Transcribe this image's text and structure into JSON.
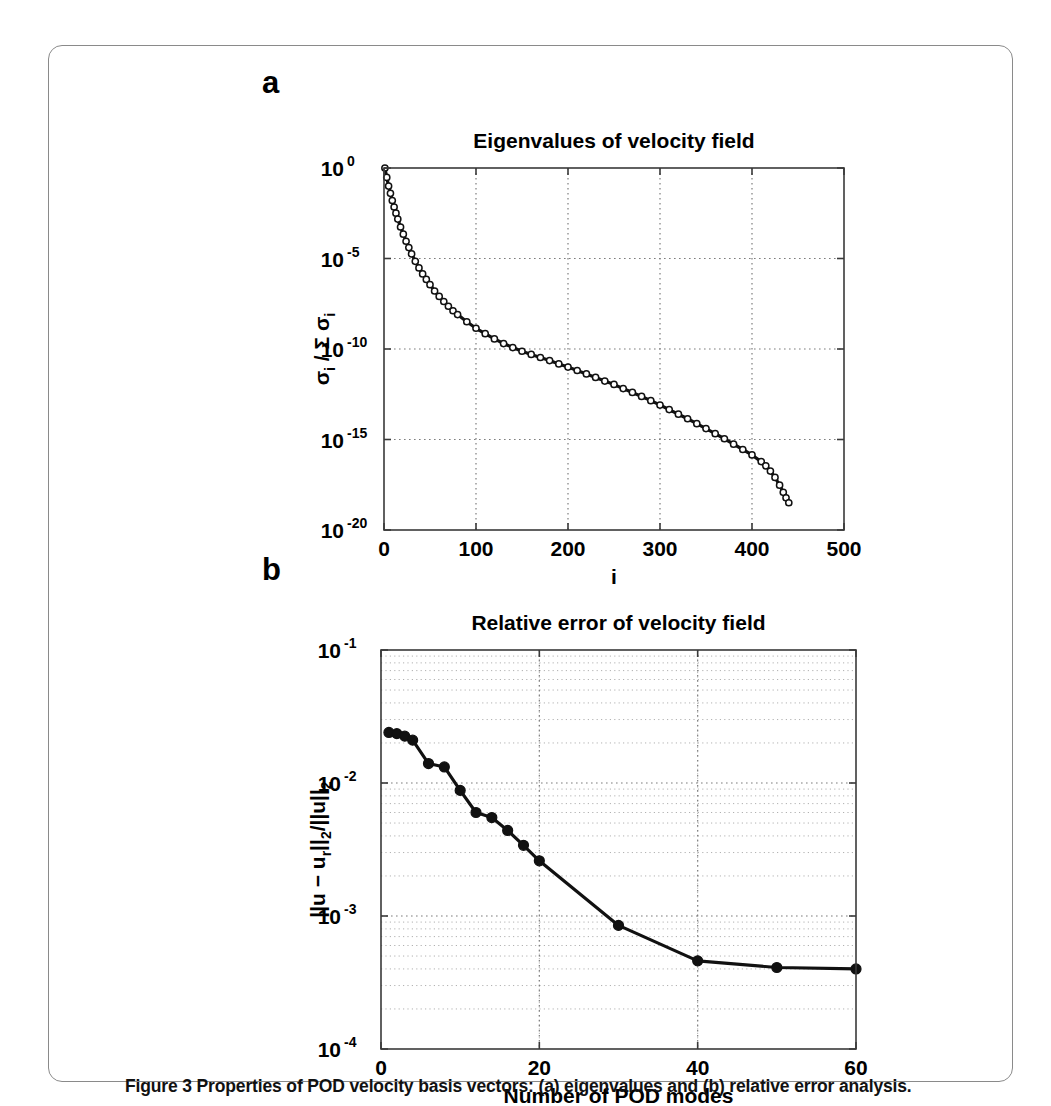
{
  "figure": {
    "caption": "Figure 3 Properties of POD velocity basis vectors: (a) eigenvalues and (b) relative error analysis.",
    "panel_a_letter": "a",
    "panel_b_letter": "b",
    "border_color": "#8a8a8a",
    "line_color": "#111111",
    "grid_color": "#7d7d7d"
  },
  "chart_data": [
    {
      "id": "panel-a",
      "type": "line",
      "title": "Eigenvalues of velocity field",
      "xlabel": "i",
      "ylabel": "σi / Σ σi",
      "ylabel_parts": {
        "sigma": "σ",
        "sub_i": "i",
        "slash": " / ",
        "sum": "Σ"
      },
      "xscale": "linear",
      "yscale": "log",
      "xlim": [
        0,
        500
      ],
      "ylim": [
        1e-20,
        1
      ],
      "xticks": [
        0,
        100,
        200,
        300,
        400,
        500
      ],
      "xtick_labels": [
        "0",
        "100",
        "200",
        "300",
        "400",
        "500"
      ],
      "yticks": [
        1,
        1e-05,
        1e-10,
        1e-15,
        1e-20
      ],
      "ytick_labels": [
        "10",
        "10",
        "10",
        "10",
        "10"
      ],
      "ytick_exponents": [
        "0",
        "-5",
        "-10",
        "-15",
        "-20"
      ],
      "grid": "major-dotted",
      "legend": "none",
      "marker": "open-circle",
      "marker_note": "dense open circles forming a thick band",
      "x": [
        1,
        3,
        5,
        7,
        9,
        11,
        13,
        15,
        18,
        21,
        24,
        27,
        30,
        34,
        38,
        42,
        46,
        50,
        55,
        60,
        65,
        70,
        75,
        80,
        90,
        100,
        110,
        120,
        130,
        140,
        150,
        160,
        170,
        180,
        190,
        200,
        210,
        220,
        230,
        240,
        250,
        260,
        270,
        280,
        290,
        300,
        310,
        320,
        330,
        340,
        350,
        360,
        370,
        380,
        390,
        400,
        410,
        415,
        420,
        425,
        430,
        434,
        437,
        440
      ],
      "values": [
        1.0,
        0.3,
        0.1,
        0.04,
        0.016,
        0.007,
        0.0032,
        0.0015,
        0.00055,
        0.00022,
        9e-05,
        4e-05,
        1.8e-05,
        7e-06,
        3e-06,
        1.4e-06,
        7e-07,
        3.6e-07,
        1.6e-07,
        8e-08,
        4.2e-08,
        2.3e-08,
        1.3e-08,
        8e-09,
        3.2e-09,
        1.4e-09,
        7e-10,
        3.6e-10,
        2e-10,
        1.2e-10,
        7.5e-11,
        5e-11,
        3.4e-11,
        2.3e-11,
        1.5e-11,
        1e-11,
        6.5e-12,
        4.2e-12,
        2.7e-12,
        1.7e-12,
        1.1e-12,
        6.5e-13,
        4e-13,
        2.4e-13,
        1.4e-13,
        8e-14,
        4.5e-14,
        2.5e-14,
        1.4e-14,
        7.5e-15,
        4e-15,
        2.1e-15,
        1.1e-15,
        5.5e-16,
        2.8e-16,
        1.4e-16,
        6e-17,
        3.5e-17,
        1.8e-17,
        8e-18,
        3e-18,
        1.2e-18,
        6e-19,
        3.2e-19
      ]
    },
    {
      "id": "panel-b",
      "type": "line",
      "title": "Relative error of velocity field",
      "xlabel": "Number of POD modes",
      "ylabel": "||u − ur||2/||u||2",
      "ylabel_parts": {
        "main_1": "||u − u",
        "sub_r": "r",
        "main_2": "||",
        "sub_2a": "2",
        "main_3": "/||u||",
        "sub_2b": "2"
      },
      "xscale": "linear",
      "yscale": "log",
      "xlim": [
        0,
        60
      ],
      "ylim": [
        0.0001,
        0.1
      ],
      "xticks": [
        0,
        20,
        40,
        60
      ],
      "xtick_labels": [
        "0",
        "20",
        "40",
        "60"
      ],
      "yticks": [
        0.1,
        0.01,
        0.001,
        0.0001
      ],
      "ytick_labels": [
        "10",
        "10",
        "10",
        "10"
      ],
      "ytick_exponents": [
        "-1",
        "-2",
        "-3",
        "-4"
      ],
      "grid": "major-and-minor-dotted",
      "legend": "none",
      "marker": "filled-circle",
      "x": [
        1,
        2,
        3,
        4,
        6,
        8,
        10,
        12,
        14,
        16,
        18,
        20,
        30,
        40,
        50,
        60
      ],
      "values": [
        0.024,
        0.0235,
        0.0225,
        0.021,
        0.014,
        0.0132,
        0.0088,
        0.006,
        0.0055,
        0.0044,
        0.0034,
        0.0026,
        0.00085,
        0.00046,
        0.00041,
        0.0004
      ]
    }
  ]
}
